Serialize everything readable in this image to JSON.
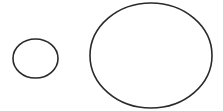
{
  "diagram": {
    "background": "#ffffff",
    "stroke_color": "#2a2a2a",
    "stroke_width": 1.6,
    "shapes": [
      {
        "name": "small-ellipse",
        "type": "ellipse",
        "cx": 35.5,
        "cy": 58.5,
        "rx": 22.5,
        "ry": 19.5
      },
      {
        "name": "large-ellipse",
        "type": "ellipse",
        "cx": 151,
        "cy": 55.5,
        "rx": 61,
        "ry": 52.5
      }
    ]
  }
}
